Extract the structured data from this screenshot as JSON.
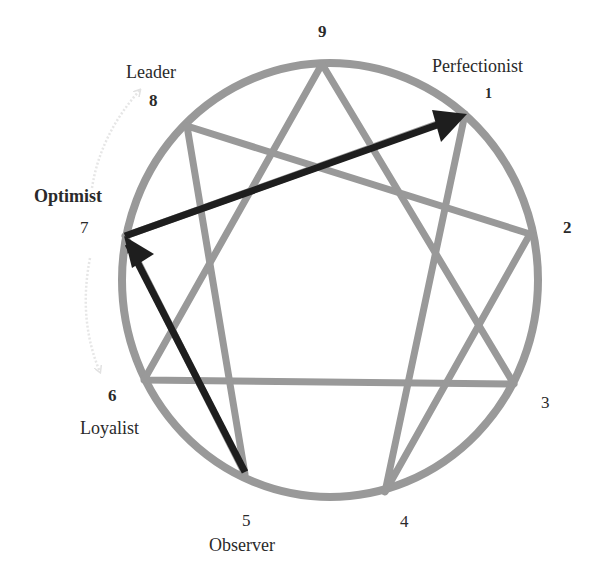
{
  "diagram": {
    "colors": {
      "circle": "#999999",
      "lines": "#999999",
      "arrow": "#1e1e1e",
      "faint_arrow": "#e4e4e4",
      "text": "#2a2a2a"
    },
    "points": [
      {
        "number": "9",
        "label": ""
      },
      {
        "number": "1",
        "label": "Perfectionist"
      },
      {
        "number": "2",
        "label": ""
      },
      {
        "number": "3",
        "label": ""
      },
      {
        "number": "4",
        "label": ""
      },
      {
        "number": "5",
        "label": "Observer"
      },
      {
        "number": "6",
        "label": "Loyalist"
      },
      {
        "number": "7",
        "label": "Optimist"
      },
      {
        "number": "8",
        "label": "Leader"
      }
    ],
    "triangle": [
      "9",
      "3",
      "6"
    ],
    "hexad": [
      "1",
      "4",
      "2",
      "8",
      "5",
      "7",
      "1"
    ],
    "highlighted_arrows": [
      {
        "from": "5",
        "to": "7"
      },
      {
        "from": "7",
        "to": "1"
      }
    ],
    "faint_curved_arrows": [
      {
        "from": "7",
        "to": "8"
      },
      {
        "from": "7",
        "to": "6"
      }
    ],
    "emphasized_label": "Optimist"
  }
}
